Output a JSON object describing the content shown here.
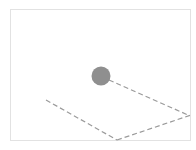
{
  "canvas": {
    "width": 196,
    "height": 150,
    "background": "#ffffff"
  },
  "frame": {
    "x": 10,
    "y": 9,
    "width": 181,
    "height": 132,
    "border_color": "#e2e2e2"
  },
  "ball": {
    "cx": 101,
    "cy": 76,
    "r": 9.5,
    "color": "#8f8f8f"
  },
  "lines": {
    "color": "#9a9a9a",
    "dash": "5,3",
    "width": 1.2,
    "segments": [
      {
        "id": "ball-to-right",
        "x1": 109,
        "y1": 80,
        "x2": 188,
        "y2": 115
      },
      {
        "id": "left-to-bottom",
        "x1": 46,
        "y1": 100,
        "x2": 117,
        "y2": 140
      },
      {
        "id": "bottom-to-right",
        "x1": 117,
        "y1": 140,
        "x2": 191,
        "y2": 115
      }
    ]
  }
}
